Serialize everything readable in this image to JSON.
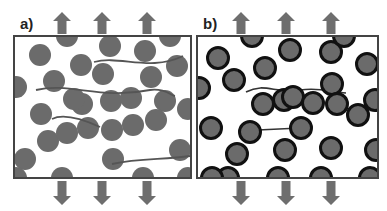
{
  "panels": [
    {
      "label": "a)",
      "description": "filler particles with polymer chains, no interphase",
      "box": {
        "x": 14,
        "y": 36,
        "w": 177,
        "h": 142
      },
      "arrows_up_x": [
        62,
        102,
        147
      ],
      "arrows_down_x": [
        62,
        102,
        147
      ],
      "particles": [
        [
          67,
          36
        ],
        [
          110,
          46
        ],
        [
          145,
          51
        ],
        [
          170,
          36
        ],
        [
          40,
          55
        ],
        [
          81,
          65
        ],
        [
          54,
          81
        ],
        [
          16,
          87
        ],
        [
          103,
          74
        ],
        [
          151,
          77
        ],
        [
          177,
          66
        ],
        [
          82,
          104
        ],
        [
          111,
          101
        ],
        [
          131,
          98
        ],
        [
          41,
          114
        ],
        [
          74,
          99
        ],
        [
          165,
          101
        ],
        [
          48,
          141
        ],
        [
          67,
          133
        ],
        [
          88,
          128
        ],
        [
          112,
          130
        ],
        [
          133,
          125
        ],
        [
          156,
          120
        ],
        [
          180,
          150
        ],
        [
          188,
          109
        ],
        [
          113,
          159
        ],
        [
          25,
          159
        ],
        [
          16,
          178
        ],
        [
          62,
          178
        ],
        [
          143,
          178
        ],
        [
          188,
          178
        ]
      ],
      "chains": [
        "M94,62 C120,55 150,72 183,56",
        "M36,90 C70,82 100,100 150,90 C165,88 170,95 175,96",
        "M52,119 C62,114 80,118 100,127",
        "M112,164 C140,158 165,160 190,156"
      ]
    },
    {
      "label": "b)",
      "description": "filler particles with bound rubber shell (interphase)",
      "box": {
        "x": 197,
        "y": 36,
        "w": 181,
        "h": 142
      },
      "arrows_up_x": [
        241,
        286,
        331
      ],
      "arrows_down_x": [
        241,
        286,
        331
      ],
      "particles": [
        [
          252,
          36
        ],
        [
          290,
          50
        ],
        [
          331,
          52
        ],
        [
          344,
          36
        ],
        [
          218,
          58
        ],
        [
          265,
          68
        ],
        [
          199,
          88
        ],
        [
          234,
          80
        ],
        [
          284,
          100
        ],
        [
          332,
          84
        ],
        [
          367,
          64
        ],
        [
          263,
          104
        ],
        [
          293,
          97
        ],
        [
          313,
          103
        ],
        [
          211,
          128
        ],
        [
          250,
          132
        ],
        [
          301,
          128
        ],
        [
          337,
          104
        ],
        [
          358,
          115
        ],
        [
          376,
          150
        ],
        [
          237,
          154
        ],
        [
          285,
          150
        ],
        [
          331,
          148
        ],
        [
          228,
          178
        ],
        [
          278,
          178
        ],
        [
          321,
          178
        ],
        [
          370,
          178
        ],
        [
          212,
          178
        ],
        [
          375,
          100
        ]
      ],
      "chains": [
        "M246,92 C265,82 275,94 300,90 C320,87 330,92 346,93",
        "M258,130 L300,128"
      ]
    }
  ],
  "colors": {
    "particle_fill": "#6b6b6b",
    "shell": "#111111",
    "chain": "#555555",
    "border": "#444444",
    "arrow": "#6e6e6e"
  }
}
